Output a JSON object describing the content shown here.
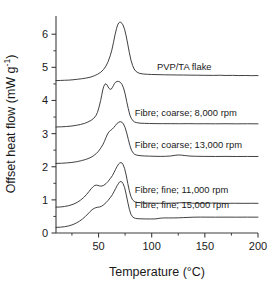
{
  "chart_data": {
    "type": "line",
    "title": "",
    "xlabel": "Temperature (°C)",
    "ylabel": "Offset heat flow (mW g⁻¹)",
    "ylabel_main": "Offset heat flow (mW g",
    "ylabel_sup": "-1",
    "ylabel_tail": ")",
    "xlim": [
      10,
      200
    ],
    "ylim": [
      0,
      6.55
    ],
    "grid": false,
    "legend_position": "inline-right-of-curve",
    "xticks": [
      50,
      100,
      150,
      200
    ],
    "xticks_minor": [
      25,
      75,
      125,
      175
    ],
    "yticks": [
      0,
      1,
      2,
      3,
      4,
      5,
      6
    ],
    "yticks_minor": [
      0.5,
      1.5,
      2.5,
      3.5,
      4.5,
      5.5
    ],
    "xtick_labels": [
      "50",
      "100",
      "150",
      "200"
    ],
    "ytick_labels": [
      "0",
      "1",
      "2",
      "3",
      "4",
      "5",
      "6"
    ],
    "series": [
      {
        "name": "PVP/TA flake",
        "label": "PVP/TA flake",
        "label_x": 105,
        "label_y": 4.93,
        "offset_baseline": 4.6,
        "points": [
          [
            10,
            4.6
          ],
          [
            14,
            4.605
          ],
          [
            18,
            4.61
          ],
          [
            22,
            4.615
          ],
          [
            26,
            4.625
          ],
          [
            30,
            4.64
          ],
          [
            34,
            4.655
          ],
          [
            38,
            4.675
          ],
          [
            42,
            4.7
          ],
          [
            46,
            4.745
          ],
          [
            49,
            4.79
          ],
          [
            52,
            4.85
          ],
          [
            55,
            4.945
          ],
          [
            57,
            5.04
          ],
          [
            59,
            5.17
          ],
          [
            61,
            5.35
          ],
          [
            62.5,
            5.52
          ],
          [
            64,
            5.74
          ],
          [
            65.5,
            5.98
          ],
          [
            67,
            6.18
          ],
          [
            68,
            6.28
          ],
          [
            69,
            6.34
          ],
          [
            70,
            6.365
          ],
          [
            71,
            6.36
          ],
          [
            72,
            6.33
          ],
          [
            73,
            6.28
          ],
          [
            74.5,
            6.15
          ],
          [
            76,
            5.95
          ],
          [
            77.5,
            5.7
          ],
          [
            79,
            5.44
          ],
          [
            80.5,
            5.22
          ],
          [
            82,
            5.06
          ],
          [
            83.5,
            4.95
          ],
          [
            85,
            4.885
          ],
          [
            87,
            4.84
          ],
          [
            89,
            4.815
          ],
          [
            92,
            4.8
          ],
          [
            96,
            4.79
          ],
          [
            100,
            4.785
          ],
          [
            106,
            4.78
          ],
          [
            112,
            4.775
          ],
          [
            118,
            4.772
          ],
          [
            124,
            4.77
          ],
          [
            130,
            4.768
          ],
          [
            136,
            4.765
          ],
          [
            142,
            4.763
          ],
          [
            150,
            4.76
          ],
          [
            158,
            4.757
          ],
          [
            164,
            4.762
          ],
          [
            170,
            4.755
          ],
          [
            176,
            4.758
          ],
          [
            182,
            4.752
          ],
          [
            188,
            4.755
          ],
          [
            194,
            4.75
          ],
          [
            200,
            4.752
          ]
        ]
      },
      {
        "name": "Fibre; coarse; 8,000 rpm",
        "label": "Fibre; coarse; 8,000 rpm",
        "label_x": 84,
        "label_y": 3.52,
        "offset_baseline": 3.2,
        "points": [
          [
            10,
            3.2
          ],
          [
            15,
            3.205
          ],
          [
            20,
            3.215
          ],
          [
            25,
            3.23
          ],
          [
            29,
            3.25
          ],
          [
            33,
            3.275
          ],
          [
            37,
            3.31
          ],
          [
            40,
            3.35
          ],
          [
            43,
            3.4
          ],
          [
            45.5,
            3.46
          ],
          [
            47.5,
            3.54
          ],
          [
            49,
            3.64
          ],
          [
            50.5,
            3.8
          ],
          [
            52,
            4.0
          ],
          [
            53,
            4.16
          ],
          [
            54,
            4.32
          ],
          [
            55,
            4.43
          ],
          [
            56,
            4.49
          ],
          [
            57,
            4.505
          ],
          [
            58,
            4.47
          ],
          [
            59,
            4.41
          ],
          [
            60,
            4.36
          ],
          [
            61,
            4.335
          ],
          [
            62,
            4.345
          ],
          [
            63,
            4.39
          ],
          [
            64,
            4.45
          ],
          [
            65,
            4.51
          ],
          [
            66,
            4.55
          ],
          [
            67.5,
            4.575
          ],
          [
            69,
            4.575
          ],
          [
            70.5,
            4.55
          ],
          [
            72,
            4.49
          ],
          [
            73.5,
            4.38
          ],
          [
            75,
            4.2
          ],
          [
            76.5,
            3.97
          ],
          [
            78,
            3.75
          ],
          [
            79.5,
            3.56
          ],
          [
            81,
            3.45
          ],
          [
            82.5,
            3.385
          ],
          [
            84,
            3.35
          ],
          [
            86,
            3.33
          ],
          [
            89,
            3.315
          ],
          [
            93,
            3.31
          ],
          [
            98,
            3.305
          ],
          [
            104,
            3.302
          ],
          [
            110,
            3.3
          ],
          [
            118,
            3.3
          ],
          [
            126,
            3.298
          ],
          [
            134,
            3.3
          ],
          [
            142,
            3.297
          ],
          [
            150,
            3.298
          ],
          [
            160,
            3.296
          ],
          [
            170,
            3.298
          ],
          [
            180,
            3.295
          ],
          [
            190,
            3.297
          ],
          [
            200,
            3.295
          ]
        ]
      },
      {
        "name": "Fibre; coarse; 13,000 rpm",
        "label": "Fibre; coarse; 13,000 rpm",
        "label_x": 84,
        "label_y": 2.57,
        "offset_baseline": 2.1,
        "points": [
          [
            10,
            2.1
          ],
          [
            15,
            2.105
          ],
          [
            20,
            2.115
          ],
          [
            25,
            2.13
          ],
          [
            30,
            2.155
          ],
          [
            34,
            2.185
          ],
          [
            38,
            2.22
          ],
          [
            42,
            2.27
          ],
          [
            45,
            2.325
          ],
          [
            48,
            2.4
          ],
          [
            50,
            2.47
          ],
          [
            52,
            2.56
          ],
          [
            54,
            2.66
          ],
          [
            55.5,
            2.76
          ],
          [
            57,
            2.88
          ],
          [
            58.5,
            2.99
          ],
          [
            60,
            3.06
          ],
          [
            61.5,
            3.1
          ],
          [
            63,
            3.14
          ],
          [
            64.5,
            3.19
          ],
          [
            66,
            3.25
          ],
          [
            67.5,
            3.31
          ],
          [
            69,
            3.345
          ],
          [
            70.5,
            3.36
          ],
          [
            72,
            3.345
          ],
          [
            73.5,
            3.29
          ],
          [
            75,
            3.18
          ],
          [
            76.5,
            3.02
          ],
          [
            78,
            2.83
          ],
          [
            79.5,
            2.64
          ],
          [
            81,
            2.5
          ],
          [
            82.5,
            2.42
          ],
          [
            84,
            2.375
          ],
          [
            86,
            2.35
          ],
          [
            89,
            2.335
          ],
          [
            93,
            2.325
          ],
          [
            98,
            2.32
          ],
          [
            103,
            2.315
          ],
          [
            108,
            2.312
          ],
          [
            113,
            2.315
          ],
          [
            118,
            2.325
          ],
          [
            122,
            2.345
          ],
          [
            125,
            2.355
          ],
          [
            128,
            2.35
          ],
          [
            132,
            2.335
          ],
          [
            136,
            2.322
          ],
          [
            142,
            2.315
          ],
          [
            150,
            2.312
          ],
          [
            160,
            2.31
          ],
          [
            170,
            2.312
          ],
          [
            180,
            2.309
          ],
          [
            190,
            2.311
          ],
          [
            200,
            2.309
          ]
        ]
      },
      {
        "name": "Fibre; fine; 11,000 rpm",
        "label": "Fibre; fine; 11,000 rpm",
        "label_x": 84,
        "label_y": 1.2,
        "offset_baseline": 0.78,
        "points": [
          [
            10,
            0.78
          ],
          [
            14,
            0.785
          ],
          [
            18,
            0.8
          ],
          [
            22,
            0.825
          ],
          [
            26,
            0.865
          ],
          [
            30,
            0.925
          ],
          [
            33,
            0.99
          ],
          [
            36,
            1.07
          ],
          [
            38.5,
            1.155
          ],
          [
            41,
            1.25
          ],
          [
            43,
            1.335
          ],
          [
            45,
            1.4
          ],
          [
            46.5,
            1.435
          ],
          [
            48,
            1.445
          ],
          [
            49.5,
            1.435
          ],
          [
            51,
            1.42
          ],
          [
            53,
            1.415
          ],
          [
            55,
            1.44
          ],
          [
            57,
            1.49
          ],
          [
            59,
            1.555
          ],
          [
            61,
            1.64
          ],
          [
            63,
            1.73
          ],
          [
            64.5,
            1.82
          ],
          [
            66,
            1.92
          ],
          [
            67.5,
            2.01
          ],
          [
            69,
            2.085
          ],
          [
            70,
            2.115
          ],
          [
            71,
            2.125
          ],
          [
            72,
            2.115
          ],
          [
            73,
            2.07
          ],
          [
            74.5,
            1.95
          ],
          [
            76,
            1.75
          ],
          [
            77.5,
            1.5
          ],
          [
            79,
            1.27
          ],
          [
            80.5,
            1.1
          ],
          [
            82,
            1.0
          ],
          [
            83.5,
            0.955
          ],
          [
            85,
            0.932
          ],
          [
            87,
            0.92
          ],
          [
            90,
            0.912
          ],
          [
            94,
            0.907
          ],
          [
            99,
            0.903
          ],
          [
            104,
            0.9
          ],
          [
            110,
            0.898
          ],
          [
            116,
            0.9
          ],
          [
            122,
            0.904
          ],
          [
            126,
            0.912
          ],
          [
            130,
            0.918
          ],
          [
            134,
            0.912
          ],
          [
            138,
            0.9
          ],
          [
            144,
            0.896
          ],
          [
            150,
            0.898
          ],
          [
            156,
            0.903
          ],
          [
            160,
            0.908
          ],
          [
            164,
            0.9
          ],
          [
            170,
            0.896
          ],
          [
            178,
            0.898
          ],
          [
            186,
            0.895
          ],
          [
            194,
            0.897
          ],
          [
            200,
            0.895
          ]
        ]
      },
      {
        "name": "Fibre; fine; 15,000 rpm",
        "label": "Fibre; fine; 15,000 rpm",
        "label_x": 84,
        "label_y": 0.74,
        "offset_baseline": 0.17,
        "points": [
          [
            10,
            0.17
          ],
          [
            14,
            0.175
          ],
          [
            18,
            0.19
          ],
          [
            22,
            0.215
          ],
          [
            26,
            0.255
          ],
          [
            29,
            0.3
          ],
          [
            32,
            0.355
          ],
          [
            35,
            0.425
          ],
          [
            37.5,
            0.495
          ],
          [
            40,
            0.575
          ],
          [
            42,
            0.645
          ],
          [
            44,
            0.705
          ],
          [
            46,
            0.745
          ],
          [
            47.5,
            0.765
          ],
          [
            49,
            0.775
          ],
          [
            51,
            0.785
          ],
          [
            53,
            0.81
          ],
          [
            55,
            0.855
          ],
          [
            57,
            0.915
          ],
          [
            59,
            0.985
          ],
          [
            61,
            1.065
          ],
          [
            63,
            1.155
          ],
          [
            64.5,
            1.245
          ],
          [
            66,
            1.335
          ],
          [
            67.5,
            1.43
          ],
          [
            69,
            1.505
          ],
          [
            70,
            1.545
          ],
          [
            71,
            1.555
          ],
          [
            72,
            1.54
          ],
          [
            73,
            1.495
          ],
          [
            74.5,
            1.375
          ],
          [
            76,
            1.17
          ],
          [
            77.5,
            0.93
          ],
          [
            79,
            0.715
          ],
          [
            80.5,
            0.565
          ],
          [
            82,
            0.49
          ],
          [
            83.5,
            0.455
          ],
          [
            85,
            0.44
          ],
          [
            87,
            0.432
          ],
          [
            90,
            0.428
          ],
          [
            94,
            0.425
          ],
          [
            99,
            0.423
          ],
          [
            103,
            0.425
          ],
          [
            106,
            0.437
          ],
          [
            109,
            0.45
          ],
          [
            112,
            0.455
          ],
          [
            116,
            0.455
          ],
          [
            120,
            0.455
          ],
          [
            125,
            0.458
          ],
          [
            130,
            0.465
          ],
          [
            135,
            0.472
          ],
          [
            140,
            0.478
          ],
          [
            146,
            0.48
          ],
          [
            152,
            0.479
          ],
          [
            160,
            0.478
          ],
          [
            170,
            0.479
          ],
          [
            180,
            0.478
          ],
          [
            190,
            0.479
          ],
          [
            200,
            0.478
          ]
        ]
      }
    ]
  }
}
